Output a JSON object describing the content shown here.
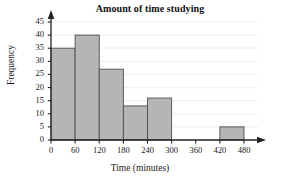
{
  "chart_data": {
    "type": "bar",
    "title": "Amount of time studying",
    "xlabel": "Time (minutes)",
    "ylabel": "Frequency",
    "categories": [
      "0-60",
      "60-120",
      "120-180",
      "180-240",
      "240-300",
      "300-360",
      "360-420",
      "420-480"
    ],
    "bin_edges": [
      0,
      60,
      120,
      180,
      240,
      300,
      360,
      420,
      480
    ],
    "values": [
      35,
      40,
      27,
      13,
      16,
      0,
      0,
      5
    ],
    "xlim": [
      0,
      480
    ],
    "ylim": [
      0,
      45
    ],
    "x_ticks": [
      0,
      60,
      120,
      180,
      240,
      300,
      360,
      420,
      480
    ],
    "y_ticks": [
      0,
      5,
      10,
      15,
      20,
      25,
      30,
      35,
      40,
      45
    ],
    "x_tick_labels": [
      "0",
      "60",
      "120",
      "180",
      "240",
      "300",
      "360",
      "420",
      "480"
    ],
    "y_tick_labels": [
      "0",
      "5",
      "10",
      "15",
      "20",
      "25",
      "30",
      "35",
      "40",
      "45"
    ],
    "grid": true,
    "legend": false,
    "bar_fill_color": "#b5b5b5",
    "bar_edge_color": "#4f4f4f",
    "axis_color": "#222222",
    "grid_color": "#f0f0f0",
    "background_color": "#ffffff"
  }
}
